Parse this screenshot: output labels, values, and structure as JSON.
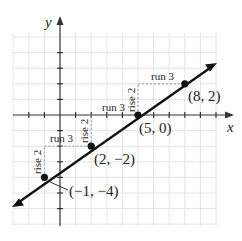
{
  "graph": {
    "axes": {
      "x_label": "x",
      "y_label": "y"
    },
    "grid": {
      "x_min": -3,
      "x_max": 10,
      "y_min": -7,
      "y_max": 5
    },
    "line": {
      "slope": "2/3",
      "color": "#111111"
    },
    "points": [
      {
        "label": "(8, 2)",
        "x": 8,
        "y": 2
      },
      {
        "label": "(5, 0)",
        "x": 5,
        "y": 0
      },
      {
        "label": "(2, −2)",
        "x": 2,
        "y": -2
      },
      {
        "label": "(−1, −4)",
        "x": -1,
        "y": -4
      }
    ],
    "annotations": {
      "run1": "run 3",
      "run2": "run 3",
      "run3": "run 3",
      "rise1": "rise 2",
      "rise2": "rise 2",
      "rise3": "rise 2"
    }
  }
}
